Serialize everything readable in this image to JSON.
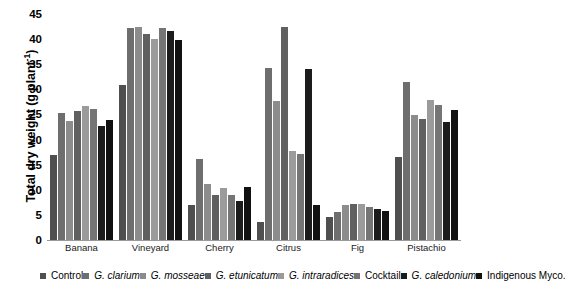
{
  "chart_data": {
    "type": "bar",
    "title": "",
    "xlabel": "",
    "ylabel": "Total dry weight (g plant⁻¹)",
    "ylabel_main": "Total dry weight (g plant",
    "ylabel_sup": "-1",
    "ylabel_tail": ")",
    "ylim": [
      0,
      45
    ],
    "yticks": [
      0,
      5,
      10,
      15,
      20,
      25,
      30,
      35,
      40,
      45
    ],
    "ytick_labels": [
      "0",
      "5",
      "10",
      "15",
      "20",
      "25",
      "30",
      "35",
      "40",
      "45"
    ],
    "grid": false,
    "legend_position": "bottom",
    "categories": [
      "Banana",
      "Vineyard",
      "Cherry",
      "Citrus",
      "Fig",
      "Pistachio"
    ],
    "series": [
      {
        "name": "Control",
        "italic": false,
        "color": "#4f4f4f",
        "values": [
          17.0,
          30.8,
          7.0,
          3.5,
          4.5,
          16.5
        ]
      },
      {
        "name": "G. clarium",
        "italic": true,
        "color": "#6e6e6e",
        "values": [
          25.3,
          42.2,
          16.2,
          34.2,
          5.5,
          31.5
        ]
      },
      {
        "name": "G. mosseae",
        "italic": true,
        "color": "#8c8c8c",
        "values": [
          23.7,
          42.4,
          11.2,
          27.6,
          7.0,
          24.8
        ]
      },
      {
        "name": "G. etunicatum",
        "italic": true,
        "color": "#606060",
        "values": [
          25.7,
          41.0,
          9.0,
          42.5,
          7.1,
          24.0
        ]
      },
      {
        "name": "G. intraradices",
        "italic": true,
        "color": "#9b9b9b",
        "values": [
          26.6,
          40.0,
          10.4,
          17.8,
          7.1,
          27.8
        ]
      },
      {
        "name": "Cocktail",
        "italic": false,
        "color": "#757575",
        "values": [
          26.0,
          42.2,
          9.0,
          17.2,
          6.6,
          26.8
        ]
      },
      {
        "name": "G. caledonium",
        "italic": true,
        "color": "#1c1c1c",
        "values": [
          22.8,
          41.6,
          7.8,
          34.0,
          6.2,
          23.4
        ]
      },
      {
        "name": "Indigenous Myco.",
        "italic": false,
        "color": "#111111",
        "values": [
          23.8,
          39.8,
          10.5,
          7.0,
          5.8,
          25.8
        ]
      }
    ]
  }
}
